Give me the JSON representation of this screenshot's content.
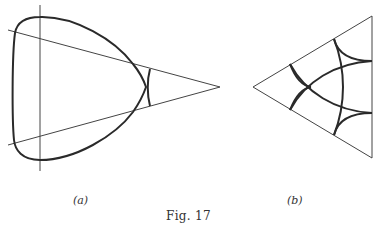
{
  "figure": {
    "caption": "Fig. 17",
    "panels": [
      {
        "id": "a",
        "label": "(a)",
        "description": "Rounded triangular closed curve with a vertical line and two lines converging to a point on the right; a short chord between the converging lines crosses the curve near its right cusp"
      },
      {
        "id": "b",
        "label": "(b)",
        "description": "Equilateral triangle containing three concave arcs near the corners and a larger circular arc network crossing the interior"
      }
    ]
  },
  "colors": {
    "stroke": "#2a2a2a",
    "thin_stroke": "#444444",
    "background": "#ffffff"
  }
}
